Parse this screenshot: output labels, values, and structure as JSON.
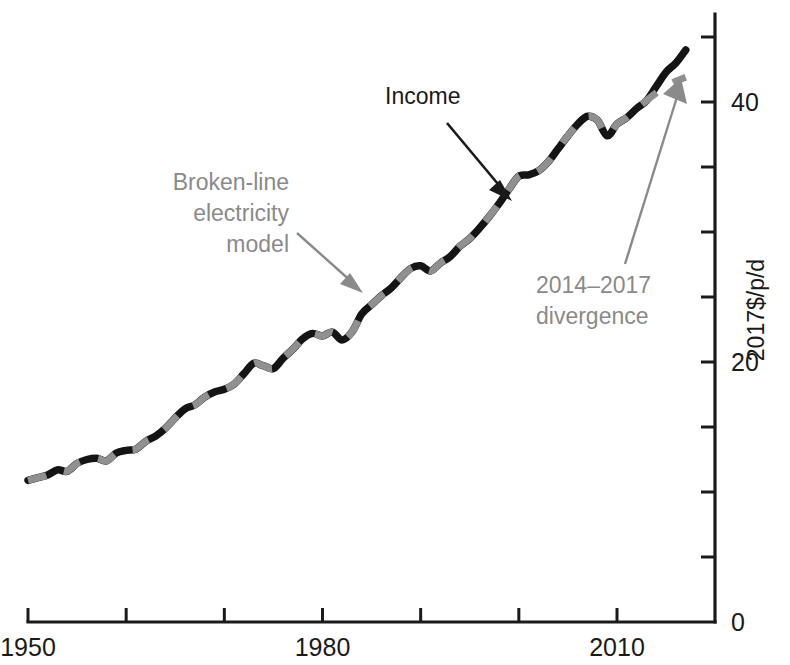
{
  "chart_data": {
    "type": "line",
    "title": "",
    "xlabel": "",
    "ylabel": "2017$/p/d",
    "xlim": [
      1950,
      2020
    ],
    "ylim": [
      0,
      47
    ],
    "grid": false,
    "legend": "none",
    "x_ticks": [
      1950,
      1960,
      1970,
      1980,
      1990,
      2000,
      2010
    ],
    "x_tick_labels": [
      "1950",
      "",
      "",
      "1980",
      "",
      "",
      "2010"
    ],
    "y_ticks": [
      0,
      5,
      10,
      15,
      20,
      25,
      30,
      35,
      40,
      45
    ],
    "y_tick_labels": [
      "0",
      "",
      "",
      "",
      "20",
      "",
      "",
      "",
      "40",
      ""
    ],
    "x": [
      1950,
      1951,
      1952,
      1953,
      1954,
      1955,
      1956,
      1957,
      1958,
      1959,
      1960,
      1961,
      1962,
      1963,
      1964,
      1965,
      1966,
      1967,
      1968,
      1969,
      1970,
      1971,
      1972,
      1973,
      1974,
      1975,
      1976,
      1977,
      1978,
      1979,
      1980,
      1981,
      1982,
      1983,
      1984,
      1985,
      1986,
      1987,
      1988,
      1989,
      1990,
      1991,
      1992,
      1993,
      1994,
      1995,
      1996,
      1997,
      1998,
      1999,
      2000,
      2001,
      2002,
      2003,
      2004,
      2005,
      2006,
      2007,
      2008,
      2009,
      2010,
      2011,
      2012,
      2013,
      2014,
      2015,
      2016,
      2017
    ],
    "series": [
      {
        "name": "Income",
        "style": "solid",
        "color": "#141414",
        "values": [
          10.9,
          11.1,
          11.3,
          11.7,
          11.6,
          12.2,
          12.5,
          12.6,
          12.4,
          13.0,
          13.2,
          13.3,
          13.9,
          14.3,
          14.9,
          15.7,
          16.4,
          16.7,
          17.3,
          17.7,
          17.9,
          18.3,
          19.1,
          19.9,
          19.7,
          19.5,
          20.3,
          21.0,
          21.8,
          22.2,
          22.0,
          22.3,
          21.7,
          22.3,
          23.7,
          24.4,
          25.1,
          25.7,
          26.5,
          27.2,
          27.4,
          27.0,
          27.6,
          28.1,
          28.9,
          29.5,
          30.3,
          31.2,
          32.2,
          33.3,
          34.3,
          34.4,
          34.7,
          35.4,
          36.4,
          37.4,
          38.3,
          38.9,
          38.6,
          37.4,
          38.3,
          38.8,
          39.5,
          40.1,
          41.2,
          42.3,
          43.0,
          44.0
        ]
      },
      {
        "name": "Broken-line electricity model",
        "style": "dashed",
        "color": "#909090",
        "values": [
          10.9,
          11.1,
          11.3,
          11.7,
          11.6,
          12.2,
          12.5,
          12.6,
          12.4,
          13.0,
          13.2,
          13.3,
          13.9,
          14.3,
          14.9,
          15.7,
          16.4,
          16.7,
          17.3,
          17.7,
          17.9,
          18.3,
          19.1,
          19.9,
          19.7,
          19.5,
          20.3,
          21.0,
          21.8,
          22.2,
          22.0,
          22.3,
          21.7,
          22.3,
          23.7,
          24.4,
          25.1,
          25.7,
          26.5,
          27.2,
          27.4,
          27.0,
          27.6,
          28.1,
          28.9,
          29.5,
          30.3,
          31.2,
          32.2,
          33.3,
          34.3,
          34.4,
          34.7,
          35.4,
          36.4,
          37.4,
          38.3,
          38.9,
          38.6,
          37.4,
          38.3,
          38.8,
          39.5,
          40.1,
          40.7,
          41.2,
          41.6,
          41.9
        ]
      }
    ],
    "annotations": [
      {
        "id": "income",
        "text": "Income",
        "color": "#1a1a1a",
        "text_x": 385,
        "text_y": 104,
        "arrow": {
          "x1": 447,
          "y1": 123,
          "x2": 510,
          "y2": 198
        }
      },
      {
        "id": "model",
        "text_lines": [
          "Broken-line",
          "electricity",
          "model"
        ],
        "color": "#8a8a8a",
        "text_x": 289,
        "text_y": 190,
        "arrow": {
          "x1": 295,
          "y1": 231,
          "x2": 360,
          "y2": 290
        }
      },
      {
        "id": "divergence",
        "text_lines": [
          "2014–2017",
          "divergence"
        ],
        "color": "#8a8a8a",
        "text_x": 536,
        "text_y": 293,
        "arrow": {
          "x1": 625,
          "y1": 264,
          "x2": 679,
          "y2": 84
        }
      }
    ]
  },
  "axes": {
    "y_axis_title": "2017$/p/d",
    "x_first_label": "1950",
    "x_mid_label": "1980",
    "x_last_label": "2010",
    "y_zero_label": "0",
    "y_twenty_label": "20",
    "y_forty_label": "40"
  }
}
